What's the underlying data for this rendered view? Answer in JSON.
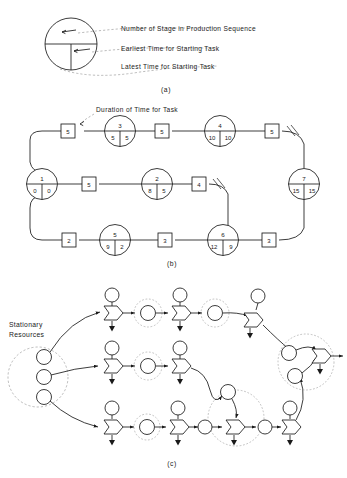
{
  "figure": {
    "panels": [
      {
        "id": "a",
        "caption": "(a)",
        "type": "legend"
      },
      {
        "id": "b",
        "caption": "(b)",
        "type": "activity-network"
      },
      {
        "id": "c",
        "caption": "(c)",
        "type": "petri-net"
      }
    ]
  },
  "legend": {
    "caption": "(a)",
    "annotations": [
      {
        "key": "stage",
        "text": "Number of Stage in Production Sequence"
      },
      {
        "key": "earliest",
        "text": "Earliest Time for Starting Task"
      },
      {
        "key": "latest",
        "text": "Latest Time for Starting Task"
      }
    ],
    "node_symbol": {
      "top_compartment": "stage number",
      "bottom_left_compartment": "earliest time",
      "bottom_right_compartment": "latest time"
    }
  },
  "panel_b": {
    "caption": "(b)",
    "duration_label": "Duration of Time for Task",
    "nodes": [
      {
        "id": "n1",
        "stage": "1",
        "earliest": "0",
        "latest": "0"
      },
      {
        "id": "n2",
        "stage": "2",
        "earliest": "8",
        "latest": "5"
      },
      {
        "id": "n3",
        "stage": "3",
        "earliest": "5",
        "latest": "5"
      },
      {
        "id": "n4",
        "stage": "4",
        "earliest": "10",
        "latest": "10"
      },
      {
        "id": "n5",
        "stage": "5",
        "earliest": "9",
        "latest": "2"
      },
      {
        "id": "n6",
        "stage": "6",
        "earliest": "12",
        "latest": "9"
      },
      {
        "id": "n7",
        "stage": "7",
        "earliest": "15",
        "latest": "15"
      }
    ],
    "durations": [
      {
        "id": "d_1_3",
        "value": "5"
      },
      {
        "id": "d_3_4",
        "value": "5"
      },
      {
        "id": "d_4_7",
        "value": "5"
      },
      {
        "id": "d_1_2",
        "value": "5"
      },
      {
        "id": "d_2_x",
        "value": "4"
      },
      {
        "id": "d_1_5",
        "value": "2"
      },
      {
        "id": "d_5_6",
        "value": "3"
      },
      {
        "id": "d_6_7",
        "value": "3"
      }
    ]
  },
  "panel_c": {
    "caption": "(c)",
    "resources_label_line1": "Stationary",
    "resources_label_line2": "Resources",
    "resource_places": 3,
    "rows": 3,
    "symbols": {
      "place": "circle",
      "transition": "pentagon-arrow",
      "cluster": "dashed-circle",
      "sink": "down-arrow"
    }
  },
  "colors": {
    "ink": "#1a1a1a",
    "dashed": "#8d8d8d",
    "paper": "#ffffff"
  }
}
